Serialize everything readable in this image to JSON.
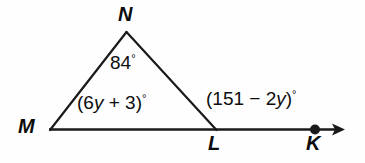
{
  "figure": {
    "type": "geometry-diagram",
    "background_color": "#fefefe",
    "stroke_color": "#1a1a1a"
  },
  "points": {
    "N": {
      "label": "N",
      "x": 126,
      "y": 32
    },
    "M": {
      "label": "M",
      "x": 50,
      "y": 130
    },
    "L": {
      "label": "L",
      "x": 216,
      "y": 130
    },
    "K": {
      "label": "K",
      "x": 315,
      "y": 129
    }
  },
  "angles": {
    "at_N": {
      "text": "84",
      "degree": "°",
      "value": 84
    },
    "at_M": {
      "open_paren": "(6",
      "var": "y",
      "rest": " + 3)",
      "degree": "°",
      "expression": "(6y + 3)°"
    },
    "at_L_exterior": {
      "open_paren": "(151 − 2",
      "var": "y",
      "rest": ")",
      "degree": "°",
      "expression": "(151 − 2y)°"
    }
  },
  "segments": [
    {
      "name": "MN",
      "from": "M",
      "to": "N"
    },
    {
      "name": "NL",
      "from": "N",
      "to": "L"
    },
    {
      "name": "MK-ray",
      "from": "M",
      "to": "K",
      "has_arrow": true
    }
  ],
  "markers": {
    "K_dot": {
      "name": "filled-point-dot",
      "radius": 4.5
    },
    "ray_arrow": {
      "name": "arrowhead",
      "tip_x": 345
    }
  }
}
